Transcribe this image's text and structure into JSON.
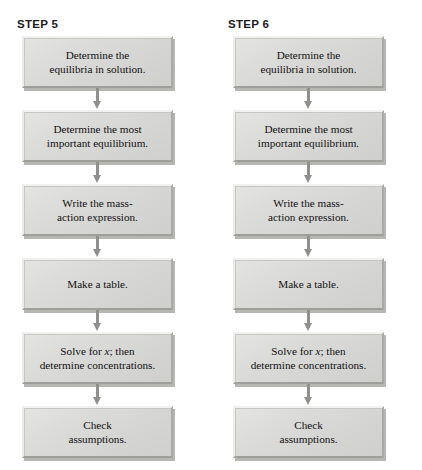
{
  "figure": {
    "type": "flowchart",
    "orientation": "vertical",
    "columns": [
      {
        "label": "STEP 5",
        "nodes": [
          {
            "line1": "Determine the",
            "line2": "equilibria in solution."
          },
          {
            "line1": "Determine the most",
            "line2": "important equilibrium."
          },
          {
            "line1": "Write the mass-",
            "line2": "action expression."
          },
          {
            "line1": "Make a table.",
            "line2": ""
          },
          {
            "line1": "Solve for x; then",
            "line2": "determine concentrations.",
            "italic_token": "x"
          },
          {
            "line1": "Check",
            "line2": "assumptions."
          }
        ]
      },
      {
        "label": "STEP 6",
        "nodes": [
          {
            "line1": "Determine the",
            "line2": "equilibria in solution."
          },
          {
            "line1": "Determine the most",
            "line2": "important equilibrium."
          },
          {
            "line1": "Write the mass-",
            "line2": "action expression."
          },
          {
            "line1": "Make a table.",
            "line2": ""
          },
          {
            "line1": "Solve for x; then",
            "line2": "determine concentrations.",
            "italic_token": "x"
          },
          {
            "line1": "Check",
            "line2": "assumptions."
          }
        ]
      }
    ],
    "colors": {
      "box_fill": "#d9d9d7",
      "box_highlight": "#f1f1ef",
      "box_shadow": "#9e9e9b",
      "arrow": "#8f8f8c",
      "text": "#111111",
      "label_text": "#1c1c1c",
      "background": "#ffffff"
    }
  }
}
